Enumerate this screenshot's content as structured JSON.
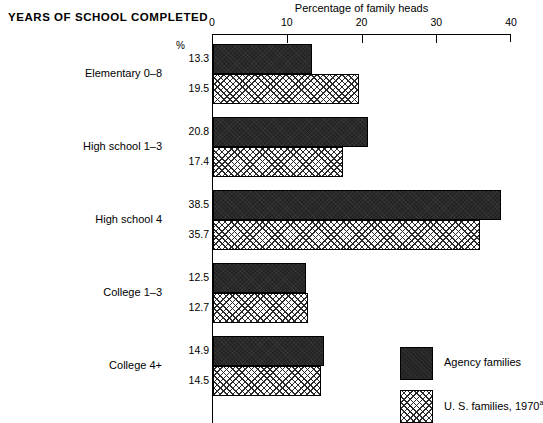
{
  "chart_data": {
    "type": "bar",
    "orientation": "horizontal",
    "title": "YEARS OF SCHOOL COMPLETED",
    "xlabel": "Percentage of family heads",
    "ylabel": "",
    "unit_marker": "%",
    "xlim": [
      0,
      40
    ],
    "xticks": [
      0,
      10,
      20,
      30,
      40
    ],
    "xtick_labels": [
      "0",
      "10",
      "20",
      "30",
      "40"
    ],
    "grid": false,
    "legend_position": "bottom-right",
    "categories": [
      "Elementary 0–8",
      "High school 1–3",
      "High school 4",
      "College 1–3",
      "College 4+"
    ],
    "series": [
      {
        "name": "Agency families",
        "fill": "solid-dark",
        "values": [
          13.3,
          20.8,
          38.5,
          12.5,
          14.9
        ],
        "value_labels": [
          "13.3",
          "20.8",
          "38.5",
          "12.5",
          "14.9"
        ]
      },
      {
        "name": "U. S. families, 1970 a",
        "fill": "crosshatch",
        "values": [
          19.5,
          17.4,
          35.7,
          12.7,
          14.5
        ],
        "value_labels": [
          "19.5",
          "17.4",
          "35.7",
          "12.7",
          "14.5"
        ]
      }
    ]
  },
  "legend": {
    "items": [
      {
        "label": "Agency families",
        "footnote": ""
      },
      {
        "label": "U. S. families, 1970",
        "footnote": "a"
      }
    ]
  },
  "colors": {
    "agency": "#242424",
    "us": "#ffffff",
    "axis": "#000000",
    "background": "#ffffff"
  }
}
